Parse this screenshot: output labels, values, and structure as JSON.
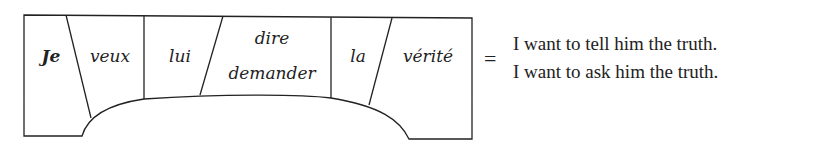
{
  "diagram": {
    "type": "sentence-slot-diagram",
    "slots": [
      {
        "id": "je",
        "words": [
          "Je"
        ],
        "bold": true
      },
      {
        "id": "veux",
        "words": [
          "veux"
        ]
      },
      {
        "id": "lui",
        "words": [
          "lui"
        ]
      },
      {
        "id": "verb",
        "words": [
          "dire",
          "demander"
        ]
      },
      {
        "id": "la",
        "words": [
          "la"
        ]
      },
      {
        "id": "verite",
        "words": [
          "vérité"
        ]
      }
    ],
    "equals_sign": "=",
    "translations": [
      "I want to tell him the truth.",
      "I want to ask him the truth."
    ],
    "colors": {
      "stroke": "#222222",
      "text": "#222222",
      "background": "#ffffff"
    }
  }
}
